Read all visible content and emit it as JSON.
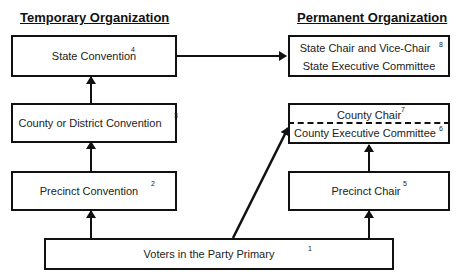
{
  "headings": {
    "temporary": "Temporary Organization",
    "permanent": "Permanent Organization"
  },
  "temporary": {
    "state_convention": {
      "label": "State Convention",
      "note": "4"
    },
    "county_convention": {
      "label": "County or District Convention",
      "note": "3"
    },
    "precinct_convention": {
      "label": "Precinct Convention",
      "note": "2"
    }
  },
  "permanent": {
    "state_chair": {
      "label": "State Chair and Vice-Chair",
      "note": "8"
    },
    "state_committee": {
      "label": "State Executive Committee"
    },
    "county_chair": {
      "label": "County Chair",
      "note": "7"
    },
    "county_committee": {
      "label": "County Executive Committee",
      "note": "6"
    },
    "precinct_chair": {
      "label": "Precinct Chair",
      "note": "5"
    }
  },
  "voters": {
    "label": "Voters in the Party Primary",
    "note": "1"
  },
  "colors": {
    "line": "#111111",
    "background": "#ffffff"
  }
}
